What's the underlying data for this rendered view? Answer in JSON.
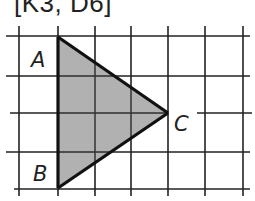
{
  "title": "[K3, D6]",
  "diagram": {
    "type": "grid-triangle",
    "grid": {
      "vertical_lines_x": [
        19,
        58,
        95,
        131,
        168,
        205,
        243
      ],
      "horizontal_lines_y": [
        36,
        76,
        113,
        152,
        189
      ],
      "line_color": "#222222"
    },
    "triangle": {
      "fill": "#a9a9a9",
      "stroke": "#111111",
      "vertices": {
        "A": {
          "x": 58,
          "y": 37
        },
        "B": {
          "x": 58,
          "y": 188
        },
        "C": {
          "x": 168,
          "y": 113
        }
      }
    },
    "labels": {
      "A": "A",
      "B": "B",
      "C": "C"
    }
  }
}
